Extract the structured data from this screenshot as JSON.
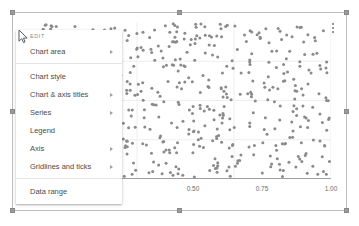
{
  "chart": {
    "overflow_menu_label": "More options",
    "y_axis_top_label": "1.00"
  },
  "context_menu": {
    "section_label": "EDIT",
    "items": [
      {
        "label": "Chart area",
        "has_submenu": true,
        "divider_after": true
      },
      {
        "label": "Chart style",
        "has_submenu": false,
        "divider_after": false
      },
      {
        "label": "Chart & axis titles",
        "has_submenu": true,
        "divider_after": false
      },
      {
        "label": "Series",
        "has_submenu": true,
        "divider_after": false
      },
      {
        "label": "Legend",
        "has_submenu": false,
        "divider_after": false
      },
      {
        "label": "Axis",
        "has_submenu": true,
        "divider_after": false
      },
      {
        "label": "Gridlines and ticks",
        "has_submenu": true,
        "divider_after": true
      },
      {
        "label": "Data range",
        "has_submenu": false,
        "divider_after": false
      }
    ]
  },
  "colors": {
    "point_fill": "#8a8a8a",
    "gridline": "#eeeeee",
    "axis_line": "#9e9e9e",
    "tick_text": "#6d6d6d",
    "selection_border": "#bdbdbd",
    "handle_fill": "#9a9a9a",
    "menu_text": "#4b4b4b"
  },
  "chart_data": {
    "type": "scatter",
    "title": "",
    "xlabel": "",
    "ylabel": "",
    "xlim": [
      0.25,
      1.0
    ],
    "ylim": [
      0.0,
      1.0
    ],
    "grid": true,
    "legend": "none",
    "marker": {
      "shape": "circle",
      "size": 3,
      "color": "#8a8a8a"
    },
    "xticks": [
      0.5,
      0.75,
      1.0
    ],
    "xtick_labels": [
      "0.50",
      "0.75",
      "1.00"
    ],
    "yticks": [
      1.0
    ],
    "ytick_labels": [
      "1.00"
    ],
    "point_count": 520,
    "points_note": "Points are uniformly distributed pseudo-random samples; generated deterministically from a fixed seed.",
    "seed": 20240517
  }
}
